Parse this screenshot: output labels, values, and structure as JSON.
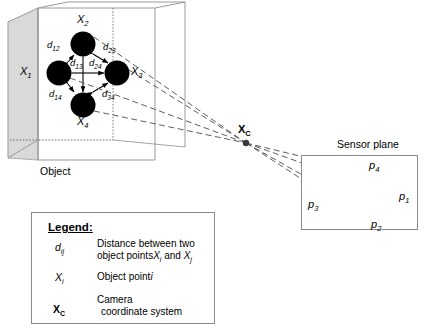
{
  "figure": {
    "object_label": "Object",
    "sensor_plane_label": "Sensor plane",
    "camera_center_label": "X",
    "camera_center_sub": "C"
  },
  "object_points": [
    {
      "id": "X1",
      "label": "X",
      "sub": "1",
      "cx": 59,
      "cy": 73,
      "r": 12.5,
      "label_x": 20,
      "label_y": 66
    },
    {
      "id": "X2",
      "label": "X",
      "sub": "2",
      "cx": 83,
      "cy": 44,
      "r": 12.5,
      "label_x": 77,
      "label_y": 14
    },
    {
      "id": "X3",
      "label": "X",
      "sub": "3",
      "cx": 117,
      "cy": 73,
      "r": 12.5,
      "label_x": 131,
      "label_y": 66
    },
    {
      "id": "X4",
      "label": "X",
      "sub": "4",
      "cx": 83,
      "cy": 105,
      "r": 12.5,
      "label_x": 77,
      "label_y": 118
    }
  ],
  "distances": [
    {
      "id": "d12",
      "label": "d",
      "sub": "12",
      "x": 49,
      "y": 44,
      "from": "X1",
      "to": "X2"
    },
    {
      "id": "d13",
      "label": "d",
      "sub": "13",
      "x": 72,
      "y": 62,
      "from": "X1",
      "to": "X3"
    },
    {
      "id": "d14",
      "label": "d",
      "sub": "14",
      "x": 51,
      "y": 95,
      "from": "X1",
      "to": "X4"
    },
    {
      "id": "d23",
      "label": "d",
      "sub": "23",
      "x": 104,
      "y": 47,
      "from": "X2",
      "to": "X3"
    },
    {
      "id": "d24",
      "label": "d",
      "sub": "24",
      "x": 90,
      "y": 62,
      "from": "X2",
      "to": "X4"
    },
    {
      "id": "d34",
      "label": "d",
      "sub": "34",
      "x": 103,
      "y": 95,
      "from": "X3",
      "to": "X4"
    }
  ],
  "image_points": [
    {
      "id": "p4",
      "label": "p",
      "sub": "4",
      "cx": 353,
      "cy": 169,
      "r": 10.5,
      "label_x": 370,
      "label_y": 162
    },
    {
      "id": "p3",
      "label": "p",
      "sub": "3",
      "cx": 336,
      "cy": 194,
      "r": 11.5,
      "label_x": 309,
      "label_y": 203
    },
    {
      "id": "p1",
      "label": "p",
      "sub": "1",
      "cx": 383,
      "cy": 192,
      "r": 11.5,
      "label_x": 400,
      "label_y": 196
    },
    {
      "id": "p2",
      "label": "p",
      "sub": "2",
      "cx": 357,
      "cy": 215,
      "r": 10.5,
      "label_x": 372,
      "label_y": 222
    }
  ],
  "camera_center": {
    "x": 246,
    "y": 143
  },
  "legend": {
    "title": "Legend:",
    "rows": [
      {
        "symbol_main": "d",
        "symbol_sub": "ij",
        "symbol_style": "italic",
        "desc_line1": "Distance between two",
        "desc_line2_a": "object points",
        "desc_line2_b": "X",
        "desc_line2_b_sub": "i",
        "desc_line2_c": " and ",
        "desc_line2_d": "X",
        "desc_line2_d_sub": "j"
      },
      {
        "symbol_main": "X",
        "symbol_sub": "i",
        "symbol_style": "italic",
        "desc_line1_a": "Object point",
        "desc_line1_b": "i"
      },
      {
        "symbol_main": "X",
        "symbol_sub": "C",
        "symbol_style": "bold",
        "desc_line1": "Camera",
        "desc_line2": "coordinate system"
      }
    ]
  },
  "colors": {
    "box_edge": "#9a9a9a",
    "box_face": "#d9d9d9",
    "point_fill": "#000000",
    "ray": "#666666",
    "frame": "#8a8a8a",
    "text": "#000000"
  }
}
